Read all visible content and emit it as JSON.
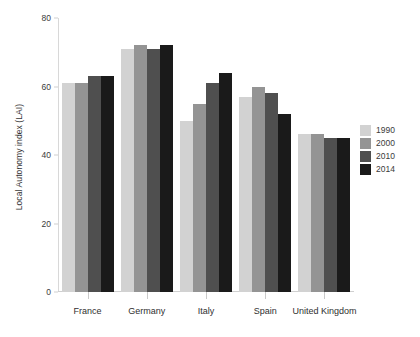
{
  "chart_data": {
    "type": "bar",
    "title": "",
    "xlabel": "",
    "ylabel": "Local Autonomy index (LAI)",
    "ylim": [
      0,
      80
    ],
    "yticks": [
      0,
      20,
      40,
      60,
      80
    ],
    "grid": false,
    "legend_position": "right",
    "categories": [
      "France",
      "Germany",
      "Italy",
      "Spain",
      "United Kingdom"
    ],
    "series": [
      {
        "name": "1990",
        "color": "#d2d2d2",
        "values": [
          61,
          71,
          50,
          57,
          46
        ]
      },
      {
        "name": "2000",
        "color": "#949494",
        "values": [
          61,
          72,
          55,
          60,
          46
        ]
      },
      {
        "name": "2010",
        "color": "#4f4f4f",
        "values": [
          63,
          71,
          61,
          58,
          45
        ]
      },
      {
        "name": "2014",
        "color": "#1a1a1a",
        "values": [
          63,
          72,
          64,
          52,
          45
        ]
      }
    ]
  },
  "legend": {
    "items": [
      {
        "label": "1990",
        "color": "#d2d2d2"
      },
      {
        "label": "2000",
        "color": "#949494"
      },
      {
        "label": "2010",
        "color": "#4f4f4f"
      },
      {
        "label": "2014",
        "color": "#1a1a1a"
      }
    ]
  }
}
